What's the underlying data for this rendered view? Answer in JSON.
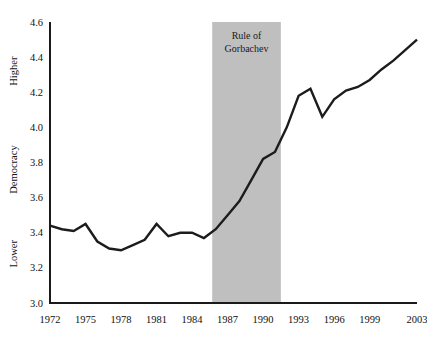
{
  "chart_data": {
    "type": "line",
    "title": "",
    "xlabel": "",
    "ylabel": "Democracy",
    "ylabel_high": "Higher",
    "ylabel_low": "Lower",
    "ylim": [
      3.0,
      4.6
    ],
    "xlim": [
      1972,
      2003
    ],
    "grid": false,
    "legend": "none",
    "line_color": "#1c1c1c",
    "axis_color": "#1a1a1a",
    "background_color": "#ffffff",
    "yticks": [
      "3.0",
      "3.2",
      "3.4",
      "3.6",
      "3.8",
      "4.0",
      "4.2",
      "4.4",
      "4.6"
    ],
    "ytick_values": [
      3.0,
      3.2,
      3.4,
      3.6,
      3.8,
      4.0,
      4.2,
      4.4,
      4.6
    ],
    "xticks": [
      "1972",
      "1975",
      "1978",
      "1981",
      "1984",
      "1987",
      "1990",
      "1993",
      "1996",
      "1999",
      "2003"
    ],
    "xtick_values": [
      1972,
      1975,
      1978,
      1981,
      1984,
      1987,
      1990,
      1993,
      1996,
      1999,
      2003
    ],
    "x": [
      1972,
      1973,
      1974,
      1975,
      1976,
      1977,
      1978,
      1979,
      1980,
      1981,
      1982,
      1983,
      1984,
      1985,
      1986,
      1987,
      1988,
      1989,
      1990,
      1991,
      1992,
      1993,
      1994,
      1995,
      1996,
      1997,
      1998,
      1999,
      2000,
      2001,
      2002,
      2003
    ],
    "values": [
      3.44,
      3.42,
      3.41,
      3.45,
      3.35,
      3.31,
      3.3,
      3.33,
      3.36,
      3.45,
      3.38,
      3.4,
      3.4,
      3.37,
      3.42,
      3.5,
      3.58,
      3.7,
      3.82,
      3.86,
      4.0,
      4.18,
      4.22,
      4.06,
      4.16,
      4.21,
      4.23,
      4.27,
      4.33,
      4.38,
      4.44,
      4.5
    ],
    "annotations": [
      {
        "name": "gorbachev-band",
        "label_line1": "Rule of",
        "label_line2": "Gorbachev",
        "x_start": 1985.7,
        "x_end": 1991.5,
        "color": "#bfbfbf"
      }
    ]
  },
  "plot_geometry": {
    "left": 50,
    "right": 417,
    "top": 22,
    "bottom": 303
  }
}
